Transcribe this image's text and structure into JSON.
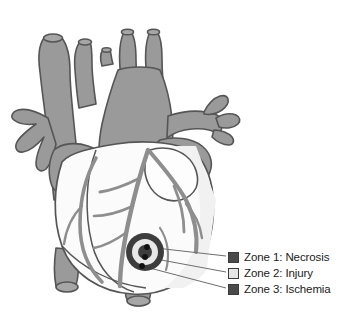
{
  "figure": {
    "background_color": "#ffffff",
    "anatomy": {
      "vessel_fill": "#9a9a9a",
      "vessel_fill_dark": "#8a8a8a",
      "vessel_fill_light": "#a8a8a8",
      "ventricle_fill": "#fbfbfb",
      "ventricle_fill_shade": "#f0f0f0",
      "outline_color": "#555555",
      "coronary_color": "#8e8e8e",
      "parts": [
        "superior-vena-cava",
        "aorta",
        "aortic-arch",
        "brachiocephalic-trunk",
        "left-common-carotid-artery",
        "left-subclavian-artery",
        "pulmonary-trunk",
        "right-pulmonary-artery",
        "left-pulmonary-veins",
        "right-atrium",
        "left-atrium",
        "right-ventricle",
        "left-ventricle",
        "coronary-arteries",
        "inferior-vena-cava",
        "descending-aorta"
      ]
    },
    "infarct_marker": {
      "name": "bullseye-infarct-zones",
      "center_x": 145,
      "center_y": 252,
      "rings": [
        {
          "zone": 3,
          "radius": 19,
          "color": "#3d3d3d"
        },
        {
          "zone": 2,
          "radius": 13,
          "color": "#e8e8e8"
        },
        {
          "zone": 1,
          "radius": 7,
          "color": "#3d3d3d"
        }
      ],
      "anchor_dots": [
        {
          "zone": 1,
          "x": 147,
          "y": 247
        },
        {
          "zone": 2,
          "x": 145,
          "y": 257
        },
        {
          "zone": 3,
          "x": 142,
          "y": 266
        }
      ],
      "leader_line_color": "#6e6e6e"
    }
  },
  "legend": {
    "items": [
      {
        "label": "Zone 1: Necrosis",
        "swatch_color": "#4a4a4a",
        "swatch_name": "zone-1-swatch"
      },
      {
        "label": "Zone 2: Injury",
        "swatch_color": "#e6e6e6",
        "swatch_name": "zone-2-swatch"
      },
      {
        "label": "Zone 3: Ischemia",
        "swatch_color": "#4a4a4a",
        "swatch_name": "zone-3-swatch"
      }
    ]
  }
}
